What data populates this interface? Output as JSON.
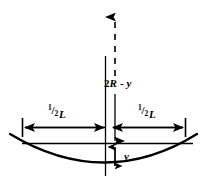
{
  "figure": {
    "background_color": "#ffffff",
    "stroke_color": "#000000",
    "width": 207,
    "height": 180
  },
  "labels": {
    "vertical_dimension": {
      "text": "2R - y",
      "prefix": "2",
      "radius_symbol": "R",
      "operator": " - ",
      "sag_symbol": "y"
    },
    "sag": {
      "text": "y"
    },
    "half_span_left": {
      "text": "1/2L",
      "numerator": "1",
      "solidus": "/",
      "denominator": "2",
      "variable": "L"
    },
    "half_span_right": {
      "text": "1/2L",
      "numerator": "1",
      "solidus": "/",
      "denominator": "2",
      "variable": "L"
    }
  },
  "elements": {
    "dashed_axis_arrow": "upward-dashed-axis",
    "center_axis": "solid-vertical-center-line",
    "chord": "horizontal-chord-line",
    "arc": "concave-up-circular-arc",
    "span_dimension_left": "left-half-span-arrow",
    "span_dimension_right": "right-half-span-arrow",
    "sag_dimension": "double-headed-sag-arrow"
  }
}
